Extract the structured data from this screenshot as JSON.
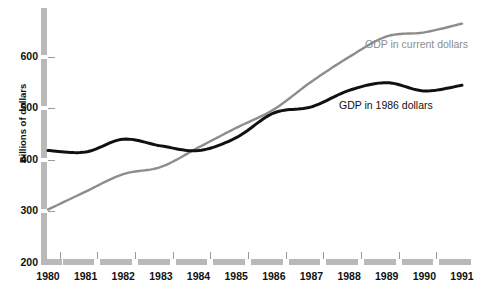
{
  "chart_data": {
    "type": "line",
    "title": "",
    "xlabel": "",
    "ylabel": "Billions of dollars",
    "ylim": [
      200,
      680
    ],
    "xlim": [
      1979.5,
      1991.5
    ],
    "grid": false,
    "legend_position": "inline-right",
    "yticks": [
      200,
      300,
      400,
      500,
      600
    ],
    "ytick_labels": [
      "200",
      "300",
      "400",
      "500",
      "600"
    ],
    "categories": [
      1980,
      1981,
      1982,
      1983,
      1984,
      1985,
      1986,
      1987,
      1988,
      1989,
      1990,
      1991
    ],
    "xtick_labels": [
      "1980",
      "1981",
      "1982",
      "1983",
      "1984",
      "1985",
      "1986",
      "1987",
      "1988",
      "1989",
      "1990",
      "1991"
    ],
    "series": [
      {
        "name": "GDP in current dollars",
        "color": "#8d8d8d",
        "label_text": "GDP in current dollars",
        "values": [
          303,
          338,
          372,
          386,
          424,
          462,
          498,
          552,
          600,
          640,
          648,
          665
        ]
      },
      {
        "name": "GDP in 1986 dollars",
        "color": "#111111",
        "label_text": "GDP in 1986 dollars",
        "values": [
          418,
          415,
          440,
          427,
          418,
          443,
          491,
          503,
          535,
          550,
          534,
          545
        ]
      }
    ],
    "annotations": [
      {
        "text": "GDP in current dollars",
        "series": "GDP in current dollars"
      },
      {
        "text": "GDP in 1986 dollars",
        "series": "GDP in 1986 dollars"
      }
    ],
    "colors": {
      "current_dollars": "#8d8d8d",
      "constant_1986_dollars": "#111111",
      "axis": "#b9b9b9",
      "background": "#ffffff",
      "text": "#111111"
    }
  }
}
